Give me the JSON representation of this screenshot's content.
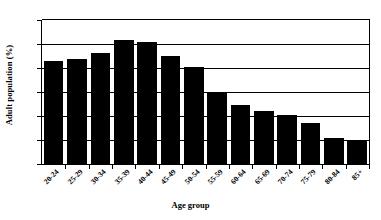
{
  "chart_data": {
    "type": "bar",
    "title": "",
    "xlabel": "Age group",
    "ylabel": "Adult population (%)",
    "categories": [
      "20-24",
      "25-29",
      "30-34",
      "35-39",
      "40-44",
      "45-49",
      "50-54",
      "55-59",
      "60-64",
      "65-69",
      "70-74",
      "75-79",
      "80-84",
      "85+"
    ],
    "values": [
      8.6,
      8.75,
      9.25,
      10.3,
      10.15,
      9.0,
      8.1,
      5.9,
      4.9,
      4.4,
      4.1,
      3.4,
      2.2,
      2.0
    ],
    "ylim": [
      0,
      12
    ],
    "yticks": [
      0,
      2,
      4,
      6,
      8,
      10,
      12
    ],
    "ytick_labels": [
      "0",
      "2",
      "4",
      "6",
      "8",
      "10",
      "12"
    ],
    "grid": "horizontal",
    "legend": "none",
    "bar_color": "#000000",
    "background_color": "#ffffff"
  }
}
